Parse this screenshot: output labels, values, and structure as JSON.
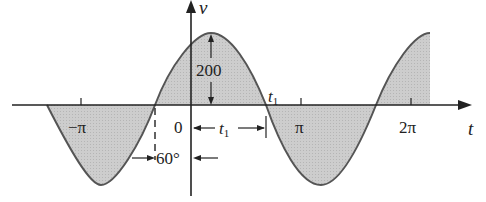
{
  "diagram": {
    "type": "sinusoid-phase-shift",
    "axes": {
      "vertical_label": "v",
      "horizontal_label": "t",
      "origin_label": "0",
      "x_ticks": [
        "−π",
        "π",
        "2π"
      ]
    },
    "annotations": {
      "amplitude": "200",
      "t1_label": "t",
      "t1_sub": "1",
      "t1_span_label": "t",
      "t1_span_sub": "1",
      "phase_label": "60°"
    },
    "colors": {
      "fill": "#c9c9c9",
      "curve": "#555555",
      "axis": "#222222"
    }
  }
}
